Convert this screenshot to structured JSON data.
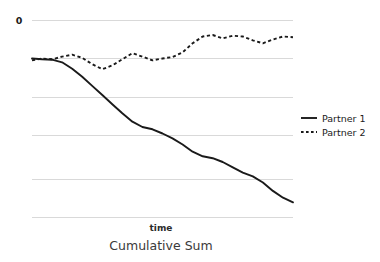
{
  "chart_data": {
    "type": "line",
    "title": "Cumulative Sum",
    "xlabel": "time",
    "ylabel": "",
    "grid": true,
    "legend_position": "right",
    "y_tick_labels": [
      "0",
      "",
      "",
      "",
      "",
      ""
    ],
    "y_axis_labeled_ticks": [
      {
        "label": "0",
        "value": 0
      }
    ],
    "ylim": [
      -5.2,
      0.5
    ],
    "xlim": [
      0,
      26
    ],
    "x_tick_labels": [],
    "annotations": [],
    "series": [
      {
        "name": "Partner 1",
        "style": "solid",
        "color": "#1a1a1a",
        "x": [
          0,
          1,
          2,
          3,
          4,
          5,
          6,
          7,
          8,
          9,
          10,
          11,
          12,
          13,
          14,
          15,
          16,
          17,
          18,
          19,
          20,
          21,
          22,
          23,
          24,
          25,
          26
        ],
        "values": [
          -1.0,
          -1.02,
          -1.03,
          -1.1,
          -1.27,
          -1.48,
          -1.72,
          -1.96,
          -2.2,
          -2.44,
          -2.66,
          -2.8,
          -2.86,
          -2.97,
          -3.1,
          -3.26,
          -3.45,
          -3.57,
          -3.62,
          -3.72,
          -3.86,
          -4.0,
          -4.1,
          -4.26,
          -4.48,
          -4.66,
          -4.78
        ]
      },
      {
        "name": "Partner 2",
        "style": "dotted",
        "color": "#1a1a1a",
        "x": [
          0,
          1,
          2,
          3,
          4,
          5,
          6,
          7,
          8,
          9,
          10,
          11,
          12,
          13,
          14,
          15,
          16,
          17,
          18,
          19,
          20,
          21,
          22,
          23,
          24,
          25,
          26
        ],
        "values": [
          -1.05,
          -1.0,
          -1.02,
          -0.95,
          -0.9,
          -0.98,
          -1.15,
          -1.28,
          -1.18,
          -1.02,
          -0.86,
          -0.95,
          -1.05,
          -1.0,
          -0.96,
          -0.84,
          -0.6,
          -0.42,
          -0.38,
          -0.47,
          -0.4,
          -0.42,
          -0.52,
          -0.6,
          -0.5,
          -0.42,
          -0.44
        ]
      }
    ]
  },
  "legend": {
    "entries": [
      {
        "label": "Partner 1",
        "style": "solid"
      },
      {
        "label": "Partner 2",
        "style": "dotted"
      }
    ]
  },
  "labels": {
    "y_zero": "0",
    "xaxis": "time",
    "caption": "Cumulative Sum"
  }
}
